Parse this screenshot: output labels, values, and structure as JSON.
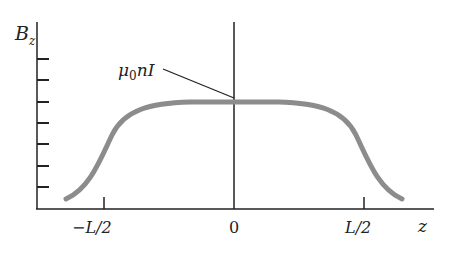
{
  "figure": {
    "y_axis_label": "B",
    "y_axis_sub": "z",
    "x_axis_label": "z",
    "annotation": {
      "mu": "μ",
      "sub": "0",
      "rest": "nI"
    },
    "x_ticks": [
      "−L/2",
      "0",
      "L/2"
    ],
    "y_tick_count": 7,
    "colors": {
      "curve": "#8c8c8c",
      "axes": "#222222"
    }
  }
}
